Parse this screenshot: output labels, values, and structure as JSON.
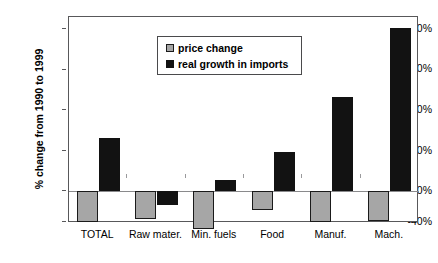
{
  "chart_data": {
    "type": "bar",
    "title": "",
    "xlabel": "",
    "ylabel": "% change from 1990 to 1999",
    "categories": [
      "TOTAL",
      "Raw mater.",
      "Min. fuels",
      "Food",
      "Manuf.",
      "Mach."
    ],
    "series": [
      {
        "name": "price change",
        "color": "#a6a6a6",
        "values": [
          -31,
          -28,
          -38,
          -19,
          -31,
          -30
        ]
      },
      {
        "name": "real growth in imports",
        "color": "#121212",
        "values": [
          52,
          -14,
          11,
          39,
          93,
          161
        ]
      }
    ],
    "ylim": [
      -40,
      180
    ],
    "yticks": [
      160,
      120,
      80,
      40,
      0,
      -40
    ],
    "ytick_labels": [
      "160%",
      "120%",
      "80%",
      "40%",
      "0%",
      "-40%"
    ],
    "grid": false,
    "legend_position": "top-left",
    "zero_line": true
  },
  "legend": {
    "items": [
      {
        "label": "price change",
        "swatch": "price-swatch"
      },
      {
        "label": "real growth in imports",
        "swatch": "imports-swatch"
      }
    ]
  },
  "axes": {
    "y_title": "% change from 1990 to 1999"
  }
}
